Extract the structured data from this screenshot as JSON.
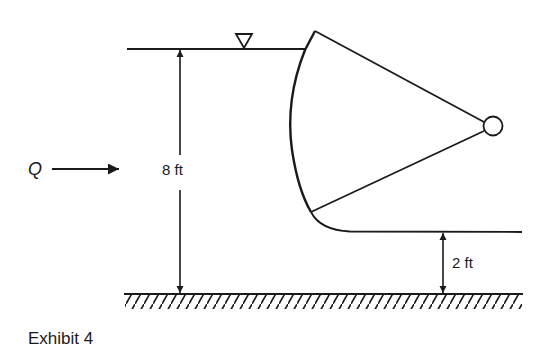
{
  "figure": {
    "caption": "Exhibit 4",
    "flow_label": "Q",
    "upstream_depth_label": "8 ft",
    "downstream_depth_label": "2 ft",
    "water_surface_symbol": "inverted-triangle",
    "elements": [
      "upstream water surface",
      "radial (Tainter) gate",
      "gate hinge/trunnion",
      "downstream water surface",
      "channel bed with hatching",
      "flow arrow",
      "depth dimension lines"
    ]
  },
  "colors": {
    "stroke": "#1a1a1a",
    "background": "#ffffff"
  }
}
